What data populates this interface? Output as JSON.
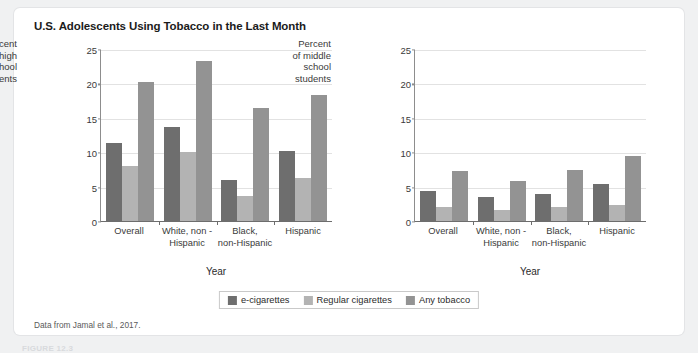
{
  "figure": {
    "title": "U.S. Adolescents Using Tobacco in the Last Month",
    "source_note": "Data from Jamal et al., 2017.",
    "caption": "FIGURE 12.3"
  },
  "colors": {
    "e_cigarettes": "#6e6e6e",
    "regular_cigarettes": "#b3b3b3",
    "any_tobacco": "#939393",
    "gridline": "#e2e2e2",
    "axis": "#6d6d6d",
    "card_background": "#ffffff",
    "page_background": "#f0f1f2"
  },
  "legend": {
    "position": "bottom-center",
    "items": [
      {
        "label": "e-cigarettes",
        "color": "#6e6e6e"
      },
      {
        "label": "Regular cigarettes",
        "color": "#b3b3b3"
      },
      {
        "label": "Any tobacco",
        "color": "#939393"
      }
    ]
  },
  "chart_data": [
    {
      "type": "bar",
      "id": "high-school",
      "title": "",
      "ylabel": "Percent of high school students",
      "ylabel_lines": [
        "Percent",
        "of high",
        "school",
        "students"
      ],
      "xlabel": "Year",
      "ylim": [
        0,
        25
      ],
      "yticks": [
        0,
        5,
        10,
        15,
        20,
        25
      ],
      "grid": true,
      "categories": [
        "Overall",
        "White, non -\nHispanic",
        "Black,\nnon-Hispanic",
        "Hispanic"
      ],
      "category_lines": [
        [
          "Overall"
        ],
        [
          "White, non -",
          "Hispanic"
        ],
        [
          "Black,",
          "non-Hispanic"
        ],
        [
          "Hispanic"
        ]
      ],
      "series": [
        {
          "name": "e-cigarettes",
          "color": "#6e6e6e",
          "values": [
            11.3,
            13.7,
            6.0,
            10.2
          ]
        },
        {
          "name": "Regular cigarettes",
          "color": "#b3b3b3",
          "values": [
            8.0,
            10.0,
            3.6,
            6.3
          ]
        },
        {
          "name": "Any tobacco",
          "color": "#939393",
          "values": [
            20.2,
            23.2,
            16.4,
            18.3
          ]
        }
      ]
    },
    {
      "type": "bar",
      "id": "middle-school",
      "title": "",
      "ylabel": "Percent of middle school students",
      "ylabel_lines": [
        "Percent",
        "of middle",
        "school",
        "students"
      ],
      "xlabel": "Year",
      "ylim": [
        0,
        25
      ],
      "yticks": [
        0,
        5,
        10,
        15,
        20,
        25
      ],
      "grid": true,
      "categories": [
        "Overall",
        "White, non -\nHispanic",
        "Black,\nnon-Hispanic",
        "Hispanic"
      ],
      "category_lines": [
        [
          "Overall"
        ],
        [
          "White, non -",
          "Hispanic"
        ],
        [
          "Black,",
          "non-Hispanic"
        ],
        [
          "Hispanic"
        ]
      ],
      "series": [
        {
          "name": "e-cigarettes",
          "color": "#6e6e6e",
          "values": [
            4.3,
            3.5,
            3.9,
            5.4
          ]
        },
        {
          "name": "Regular cigarettes",
          "color": "#b3b3b3",
          "values": [
            2.0,
            1.6,
            2.0,
            2.3
          ]
        },
        {
          "name": "Any tobacco",
          "color": "#939393",
          "values": [
            7.2,
            5.8,
            7.4,
            9.4
          ]
        }
      ]
    }
  ]
}
